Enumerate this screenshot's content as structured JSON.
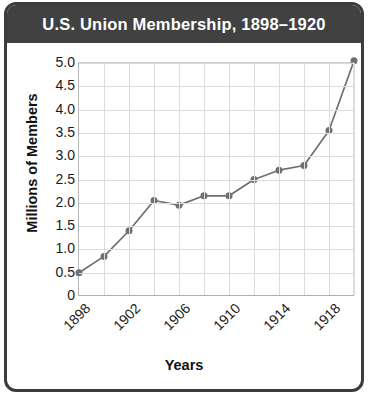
{
  "figure": {
    "title": "U.S. Union Membership, 1898–1920",
    "title_band_color": "#414141",
    "title_text_color": "#ffffff",
    "border_color": "#3c3c3c",
    "background": "#ffffff"
  },
  "chart_data": {
    "type": "line",
    "title": "U.S. Union Membership, 1898–1920",
    "xlabel": "Years",
    "ylabel": "Millions of Members",
    "x": [
      1898,
      1900,
      1902,
      1904,
      1906,
      1908,
      1910,
      1912,
      1914,
      1916,
      1918,
      1920
    ],
    "values": [
      0.5,
      0.85,
      1.4,
      2.05,
      1.95,
      2.15,
      2.15,
      2.5,
      2.7,
      2.8,
      3.55,
      5.05
    ],
    "series": [
      {
        "name": "Union membership",
        "values": [
          0.5,
          0.85,
          1.4,
          2.05,
          1.95,
          2.15,
          2.15,
          2.5,
          2.7,
          2.8,
          3.55,
          5.05
        ],
        "color": "#6f6f6f",
        "marker": "circle"
      }
    ],
    "xlim": [
      1898,
      1920
    ],
    "ylim": [
      0,
      5.0
    ],
    "xticks": [
      1898,
      1902,
      1906,
      1910,
      1914,
      1918
    ],
    "xtick_labels": [
      "1898",
      "1902",
      "1906",
      "1910",
      "1914",
      "1918"
    ],
    "xtick_rotation": -45,
    "yticks": [
      0,
      0.5,
      1.0,
      1.5,
      2.0,
      2.5,
      3.0,
      3.5,
      4.0,
      4.5,
      5.0
    ],
    "ytick_labels": [
      "0",
      "0.5",
      "1.0",
      "1.5",
      "2.0",
      "2.5",
      "3.0",
      "3.5",
      "4.0",
      "4.5",
      "5.0"
    ],
    "grid": true,
    "grid_color": "#dcdcdc",
    "vertical_gridline_years": [
      1900,
      1902,
      1904,
      1906,
      1908,
      1910,
      1912,
      1914,
      1916,
      1918,
      1920
    ],
    "legend": null,
    "line_color": "#6f6f6f",
    "marker_color": "#6f6f6f",
    "marker_size": 7
  }
}
